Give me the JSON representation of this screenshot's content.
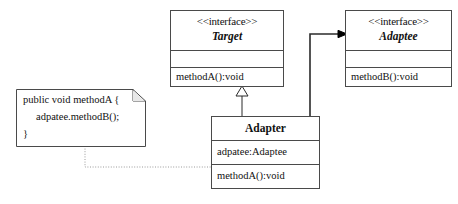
{
  "diagram": {
    "kind": "uml-class-diagram",
    "background_color": "#ffffff",
    "line_color": "#2b2b2b",
    "text_color": "#111111"
  },
  "target_interface": {
    "stereotype": "<<interface>>",
    "name": "Target",
    "attributes": [
      ""
    ],
    "operations": [
      "methodA():void"
    ]
  },
  "adaptee_interface": {
    "stereotype": "<<interface>>",
    "name": "Adaptee",
    "attributes": [
      ""
    ],
    "operations": [
      "methodB():void"
    ]
  },
  "adapter_class": {
    "name": "Adapter",
    "attributes": [
      "adpatee:Adaptee"
    ],
    "operations": [
      "methodA():void"
    ]
  },
  "code_note": {
    "lines": [
      "public void methodA {",
      "   adpatee.methodB();",
      "}"
    ],
    "line1": "public void methodA {",
    "line2": "adpatee.methodB();",
    "line3": "}"
  },
  "relationships": {
    "realization": {
      "label": "",
      "from": "Adapter",
      "to": "Target",
      "arrow": "hollow-triangle"
    },
    "association": {
      "label": "",
      "from": "Adapter",
      "to": "Adaptee",
      "arrow": "solid-arrowhead"
    },
    "note_anchor": {
      "label": "",
      "from": "code-note",
      "to": "Adapter.methodA():void",
      "arrow": "dotted-line"
    }
  }
}
